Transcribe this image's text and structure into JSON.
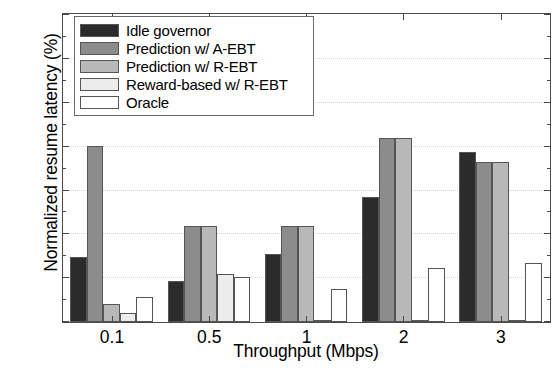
{
  "chart_data": {
    "type": "bar",
    "title": "",
    "xlabel": "Throughput (Mbps)",
    "ylabel": "Normalized resume latency (%)",
    "categories": [
      "0.1",
      "0.5",
      "1",
      "2",
      "3"
    ],
    "ylim": [
      0,
      35
    ],
    "yticks": [
      0,
      5,
      10,
      15,
      20,
      25,
      30,
      35
    ],
    "ytick_labels": [
      "0",
      "5",
      "10",
      "15",
      "20",
      "25",
      "30",
      "35"
    ],
    "grid": true,
    "legend_position": "upper left",
    "series": [
      {
        "name": "Idle governor",
        "color": "#2b2b2b",
        "values": [
          7.4,
          4.7,
          7.8,
          14.2,
          19.4
        ]
      },
      {
        "name": "Prediction w/ A-EBT",
        "color": "#8c8c8c",
        "values": [
          20.0,
          10.9,
          10.9,
          21.0,
          18.2
        ]
      },
      {
        "name": "Prediction w/ R-EBT",
        "color": "#b8b8b8",
        "values": [
          2.0,
          10.9,
          10.9,
          21.0,
          18.2
        ]
      },
      {
        "name": "Reward-based w/ R-EBT",
        "color": "#ececec",
        "values": [
          1.0,
          5.5,
          0.15,
          0.2,
          0.2
        ]
      },
      {
        "name": "Oracle",
        "color": "#ffffff",
        "values": [
          2.8,
          5.1,
          3.8,
          6.2,
          6.7
        ]
      }
    ]
  }
}
